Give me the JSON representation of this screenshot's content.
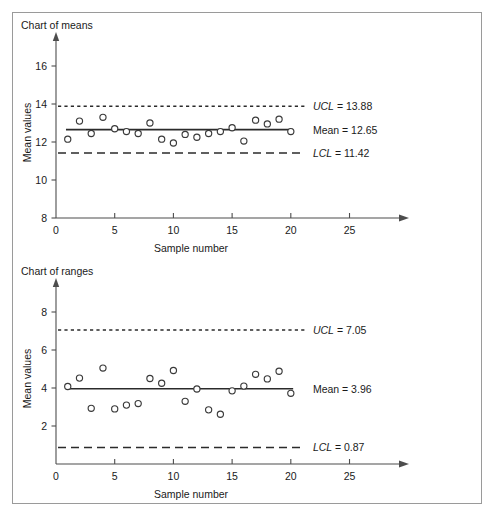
{
  "page": {
    "background_color": "#ffffff",
    "frame_border_color": "#9a9a9a"
  },
  "charts": [
    {
      "id": "chart-of-means",
      "title": "Chart of means",
      "xlabel": "Sample number",
      "ylabel": "Mean values"
    },
    {
      "id": "chart-of-ranges",
      "title": "Chart of ranges",
      "xlabel": "Sample number",
      "ylabel": "Mean values"
    }
  ],
  "annotations": {
    "means": {
      "ucl_label": "UCL",
      "ucl_text": "= 13.88",
      "mean_text": "Mean = 12.65",
      "lcl_label": "LCL",
      "lcl_text": "= 11.42"
    },
    "ranges": {
      "ucl_label": "UCL",
      "ucl_text": "= 7.05",
      "mean_text": "Mean = 3.96",
      "lcl_label": "LCL",
      "lcl_text": "= 0.87"
    }
  },
  "chart_data": [
    {
      "type": "scatter",
      "title": "Chart of means",
      "xlabel": "Sample number",
      "ylabel": "Mean values",
      "xlim": [
        0,
        27
      ],
      "ylim": [
        8,
        17
      ],
      "xticks": [
        0,
        5,
        10,
        15,
        20,
        25
      ],
      "yticks": [
        8,
        10,
        12,
        14,
        16
      ],
      "grid": false,
      "legend": "right-annotations",
      "series": [
        {
          "name": "Sample means",
          "marker": "open-circle",
          "x": [
            1,
            2,
            3,
            4,
            5,
            6,
            7,
            8,
            9,
            10,
            11,
            12,
            13,
            14,
            15,
            16,
            17,
            18,
            19,
            20
          ],
          "values": [
            12.15,
            13.1,
            12.45,
            13.3,
            12.7,
            12.55,
            12.45,
            13.0,
            12.15,
            11.95,
            12.4,
            12.25,
            12.45,
            12.55,
            12.75,
            12.05,
            13.15,
            12.95,
            13.2,
            12.55
          ]
        }
      ],
      "center_line": {
        "name": "Mean",
        "value": 12.65,
        "style": "solid"
      },
      "control_limits": [
        {
          "name": "UCL",
          "value": 13.88,
          "style": "dotted"
        },
        {
          "name": "LCL",
          "value": 11.42,
          "style": "dashed"
        }
      ]
    },
    {
      "type": "scatter",
      "title": "Chart of ranges",
      "xlabel": "Sample number",
      "ylabel": "Mean values",
      "xlim": [
        0,
        27
      ],
      "ylim": [
        0,
        9
      ],
      "xticks": [
        0,
        5,
        10,
        15,
        20,
        25
      ],
      "yticks": [
        2,
        4,
        6,
        8
      ],
      "grid": false,
      "legend": "right-annotations",
      "series": [
        {
          "name": "Sample ranges",
          "marker": "open-circle",
          "x": [
            1,
            2,
            3,
            4,
            5,
            6,
            7,
            8,
            9,
            10,
            11,
            12,
            13,
            14,
            15,
            16,
            17,
            18,
            19,
            20
          ],
          "values": [
            4.08,
            4.52,
            2.93,
            5.05,
            2.9,
            3.1,
            3.18,
            4.5,
            4.25,
            4.92,
            3.3,
            3.95,
            2.85,
            2.62,
            3.85,
            4.1,
            4.72,
            4.48,
            4.88,
            3.72
          ]
        }
      ],
      "center_line": {
        "name": "Mean",
        "value": 3.96,
        "style": "solid"
      },
      "control_limits": [
        {
          "name": "UCL",
          "value": 7.05,
          "style": "dotted"
        },
        {
          "name": "LCL",
          "value": 0.87,
          "style": "dashed"
        }
      ]
    }
  ]
}
